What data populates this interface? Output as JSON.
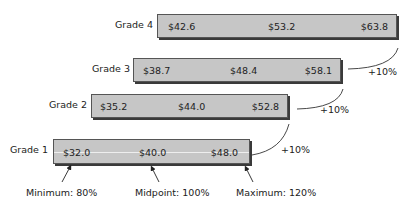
{
  "grades": [
    {
      "label": "Grade 4",
      "min": "$42.6",
      "mid": "$53.2",
      "max": "$63.8"
    },
    {
      "label": "Grade 3",
      "min": "$38.7",
      "mid": "$48.4",
      "max": "$58.1"
    },
    {
      "label": "Grade 2",
      "min": "$35.2",
      "mid": "$44.0",
      "max": "$52.8"
    },
    {
      "label": "Grade 1",
      "min": "$32.0",
      "mid": "$40.0",
      "max": "$48.0"
    }
  ],
  "step_labels": [
    "+10%",
    "+10%",
    "+10%"
  ],
  "annotations": {
    "minimum": "Minimum: 80%",
    "midpoint": "Midpoint: 100%",
    "maximum": "Maximum: 120%"
  },
  "colors": {
    "bar_fill": "#c6c6c6",
    "bar_border": "#555555",
    "shadow": "#3a3a3a"
  }
}
